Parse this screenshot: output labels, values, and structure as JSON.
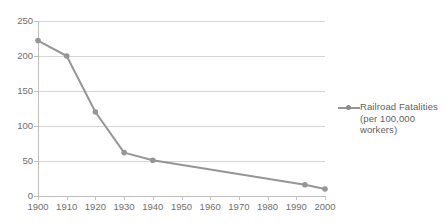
{
  "chart_data": {
    "type": "line",
    "title": "",
    "xlabel": "",
    "ylabel": "",
    "xlim": [
      1900,
      2000
    ],
    "ylim": [
      0,
      250
    ],
    "ytick_labels": [
      "250",
      "200",
      "150",
      "100",
      "50",
      "0"
    ],
    "ytick_values": [
      250,
      200,
      150,
      100,
      50,
      0
    ],
    "xtick_labels": [
      "1900",
      "1910",
      "1920",
      "1930",
      "1940",
      "1950",
      "1960",
      "1970",
      "1980",
      "1990",
      "2000"
    ],
    "xtick_values": [
      1900,
      1910,
      1920,
      1930,
      1940,
      1950,
      1960,
      1970,
      1980,
      1990,
      2000
    ],
    "grid": true,
    "legend_position": "right",
    "series": [
      {
        "name": "Railroad Fatalities (per 100,000 workers)",
        "color": "#969696",
        "marker": "circle",
        "x": [
          1900,
          1910,
          1920,
          1930,
          1940,
          1993,
          2000
        ],
        "values": [
          222,
          200,
          120,
          62,
          51,
          16,
          10
        ]
      }
    ]
  },
  "legend": {
    "entries": [
      {
        "line1": "Railroad Fatalities",
        "line2": "(per 100,000",
        "line3": "workers)"
      }
    ]
  },
  "colors": {
    "series": "#969696",
    "gridline": "#d4d4d4",
    "axis": "#bfbfbf",
    "tick_text": "#6f6f6f",
    "legend_text": "#5f5f5f",
    "background": "#ffffff"
  }
}
